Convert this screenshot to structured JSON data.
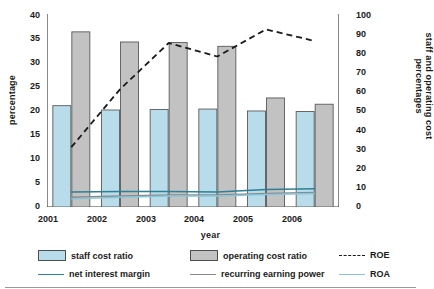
{
  "chart_data": {
    "type": "bar",
    "title": "",
    "subtitle": "",
    "xlabel": "year",
    "ylabel": "percentage",
    "ylabel_right": "staff and operating cost percentages",
    "categories": [
      "2001",
      "2002",
      "2003",
      "2004",
      "2005",
      "2006"
    ],
    "ylim": [
      0,
      40
    ],
    "yticks": [
      0,
      5,
      10,
      15,
      20,
      25,
      30,
      35,
      40
    ],
    "ylim_right": [
      0,
      100
    ],
    "yticks_right": [
      0,
      10,
      20,
      30,
      40,
      50,
      60,
      70,
      80,
      90,
      100
    ],
    "grid": false,
    "legend_position": "bottom",
    "series": [
      {
        "name": "staff cost ratio",
        "kind": "bar",
        "axis": "right",
        "color": "#b9dcea",
        "edge": "#5a5a5a",
        "values": [
          54.5,
          52.0,
          52.5,
          53.0,
          51.7,
          51.4
        ]
      },
      {
        "name": "operating cost ratio",
        "kind": "bar",
        "axis": "right",
        "color": "#c2c2c2",
        "edge": "#5a5a5a",
        "values": [
          94.2,
          89.0,
          86.5,
          86.5,
          58.7,
          55.5
        ]
      },
      {
        "name": "ROE",
        "kind": "line",
        "style": "dashed",
        "axis": "right",
        "color": "#1a1a1a",
        "values": [
          31,
          61,
          85,
          78,
          92,
          86
        ]
      },
      {
        "name": "net interest margin",
        "kind": "line",
        "style": "solid",
        "axis": "left",
        "color": "#2d7f95",
        "values": [
          3.1,
          3.2,
          3.2,
          3.1,
          3.6,
          3.8
        ]
      },
      {
        "name": "recurring earning power",
        "kind": "line",
        "style": "solid",
        "axis": "left",
        "color": "#8a8a8a",
        "values": [
          2.0,
          2.3,
          2.5,
          2.5,
          2.8,
          3.0
        ]
      },
      {
        "name": "ROA",
        "kind": "line",
        "style": "solid",
        "axis": "left",
        "color": "#86c6dc",
        "values": [
          1.7,
          2.0,
          2.3,
          2.3,
          2.6,
          2.8
        ]
      }
    ],
    "bar_values_left_axis": {
      "staff cost ratio": [
        21.0,
        20.1,
        20.2,
        20.3,
        19.9,
        19.8
      ],
      "operating cost ratio": [
        36.3,
        34.2,
        34.1,
        33.3,
        22.6,
        21.3
      ]
    }
  },
  "legend": {
    "row1": [
      "staff cost ratio",
      "operating cost ratio",
      "ROE"
    ],
    "row2": [
      "net interest margin",
      "recurring earning power",
      "ROA"
    ]
  }
}
